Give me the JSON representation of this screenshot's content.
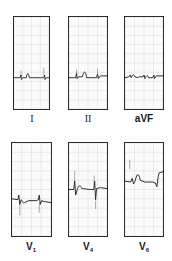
{
  "colors": {
    "trace": "#222222",
    "grid": "#bdbdbd",
    "border": "#2a2a2a"
  },
  "panels": [
    {
      "id": "I",
      "label": "I",
      "style": "roman",
      "trace": "M0,66 L14,66 L16,63 L17,68 L20,66 L28,66 C30,60 33,60 35,66 L45,66 L60,66 L68,66 L70,63 L71,68 L74,66 L80,66",
      "spikes": [
        [
          16,
          58,
          16,
          64
        ],
        [
          68,
          55,
          68,
          63
        ]
      ]
    },
    {
      "id": "II",
      "label": "II",
      "style": "roman",
      "trace": "M0,66 L14,66 L16,61 L17,67 L20,65 L28,65 C31,58 35,58 37,66 L55,66 L58,66 L60,62 L62,67 L66,64 L80,64",
      "spikes": [
        [
          16,
          57,
          16,
          62
        ],
        [
          60,
          56,
          60,
          62
        ]
      ]
    },
    {
      "id": "aVF",
      "label": "aVF",
      "style": "lead",
      "trace": "M0,66 L8,65 L11,63 L13,66 C16,62 19,62 21,65 C24,66 27,66 30,65 L38,65 L40,63 L42,67 C45,63 48,63 50,66 L58,66 L61,63 L62,67 L66,64 L80,64",
      "spikes": []
    },
    {
      "id": "V1",
      "label": "V1",
      "main": "V",
      "sub": "1",
      "style": "lead",
      "trace": "M0,60 L12,61 L14,56 L16,66 L19,61 C22,63 24,66 26,64 L34,62 L50,62 L54,61 L56,56 L58,66 L61,62 L66,63 L80,64",
      "spikes": [
        [
          16,
          66,
          16,
          78
        ],
        [
          56,
          64,
          56,
          75
        ]
      ]
    },
    {
      "id": "V4",
      "label": "V4",
      "main": "V",
      "sub": "4",
      "style": "lead",
      "trace": "M0,50 L10,50 L12,41 L14,56 L18,49 C21,45 24,45 27,49 L46,50 L52,50 L54,41 L56,61 L58,49 L66,48 L80,49",
      "spikes": [
        [
          12,
          30,
          12,
          42
        ],
        [
          53,
          35,
          53,
          43
        ],
        [
          56,
          62,
          56,
          71
        ]
      ]
    },
    {
      "id": "V6",
      "label": "V6",
      "main": "V",
      "sub": "6",
      "style": "lead",
      "trace": "M0,41 L12,42 L15,38 L18,44 L22,40 C25,32 29,32 32,40 L42,42 L58,42 L64,43 L67,47 L70,36 L72,32 L80,31",
      "spikes": [
        [
          10,
          18,
          10,
          28
        ]
      ]
    }
  ]
}
